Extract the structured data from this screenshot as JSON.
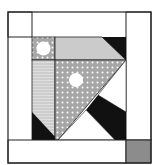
{
  "colors": {
    "black": "#111111",
    "white": "#ffffff",
    "light_gray": "#c8c8c8",
    "dotted_gray": "#a8a8a8",
    "stripe_gray": "#cfcfcf",
    "gray_10": "#8c8c8c",
    "border": "#222222"
  },
  "pieces": {
    "p1": "1",
    "p2_right": "2",
    "p2_bottom": "2",
    "p3_upper": "3",
    "p3_lower": "3",
    "p4": "4",
    "p5_upper": "5",
    "p5_lower": "5",
    "p6": "6",
    "p7": "7",
    "p8": "8",
    "p9": "9",
    "p10": "10",
    "p11": "11"
  },
  "top_row_eleven_count": 4,
  "left_col_eleven_count": 4
}
